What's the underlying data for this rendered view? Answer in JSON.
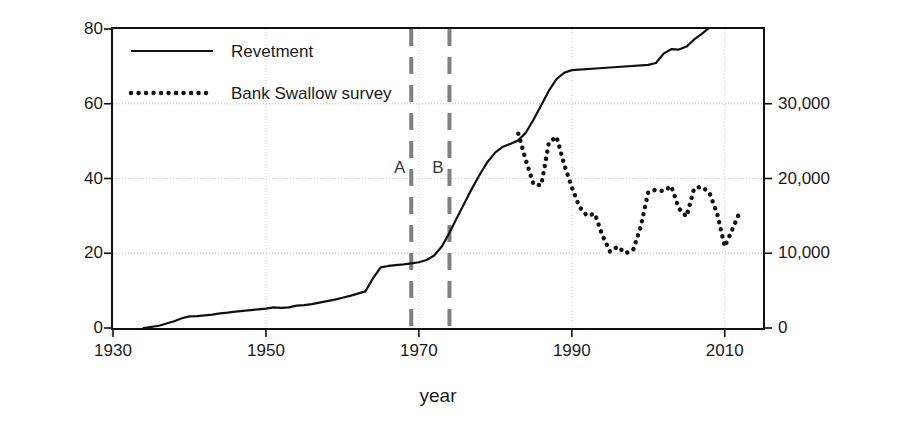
{
  "chart_data": {
    "type": "line",
    "title": "",
    "xlabel": "year",
    "ylabel_left": "Revetment length (km)",
    "ylabel_right": "Bank Swallow burrows",
    "xlim": [
      1930,
      2015
    ],
    "ylim_left": [
      0,
      80
    ],
    "ylim_right": [
      0,
      40000
    ],
    "xticks": [
      1930,
      1950,
      1970,
      1990,
      2010
    ],
    "xticklabels": [
      "1930",
      "1950",
      "1970",
      "1990",
      "2010"
    ],
    "yticks_left": [
      0,
      20,
      40,
      60,
      80
    ],
    "yticklabels_left": [
      "0",
      "20",
      "40",
      "60",
      "80"
    ],
    "yticks_right": [
      0,
      10000,
      20000,
      30000
    ],
    "yticklabels_right": [
      "0",
      "10,000",
      "20,000",
      "30,000"
    ],
    "grid": true,
    "grid_color": "#cccccc",
    "legend_position": "top-left",
    "series": [
      {
        "name": "Revetment",
        "style": "solid",
        "color": "#111111",
        "axis": "left",
        "x": [
          1934,
          1936,
          1938,
          1939,
          1940,
          1941,
          1942,
          1943,
          1944,
          1945,
          1946,
          1947,
          1948,
          1949,
          1950,
          1951,
          1952,
          1953,
          1954,
          1955,
          1956,
          1957,
          1958,
          1959,
          1960,
          1961,
          1962,
          1963,
          1964,
          1965,
          1966,
          1967,
          1968,
          1969,
          1970,
          1971,
          1972,
          1973,
          1974,
          1975,
          1976,
          1977,
          1978,
          1979,
          1980,
          1981,
          1982,
          1983,
          1984,
          1985,
          1986,
          1987,
          1988,
          1989,
          1990,
          1995,
          2000,
          2001,
          2002,
          2003,
          2004,
          2005,
          2006,
          2007,
          2008,
          2009
        ],
        "y": [
          0.0,
          0.6,
          1.8,
          2.6,
          3.1,
          3.2,
          3.4,
          3.6,
          3.9,
          4.1,
          4.4,
          4.6,
          4.8,
          5.0,
          5.2,
          5.5,
          5.4,
          5.5,
          6.0,
          6.1,
          6.4,
          6.8,
          7.2,
          7.6,
          8.1,
          8.6,
          9.2,
          9.8,
          13.3,
          16.2,
          16.6,
          16.8,
          17.0,
          17.3,
          17.6,
          18.2,
          19.4,
          21.8,
          25.5,
          29.6,
          33.6,
          37.5,
          41.2,
          44.5,
          47.0,
          48.5,
          49.3,
          50.2,
          52.3,
          55.8,
          59.6,
          63.5,
          66.6,
          68.3,
          69.0,
          69.7,
          70.4,
          70.9,
          73.4,
          74.6,
          74.5,
          75.3,
          77.2,
          78.7,
          80.4,
          81.8
        ]
      },
      {
        "name": "Bank Swallow survey",
        "style": "dotted",
        "color": "#111111",
        "axis": "right",
        "x": [
          1983,
          1984,
          1985,
          1986,
          1987,
          1988,
          1989,
          1990,
          1991,
          1992,
          1993,
          1994,
          1995,
          1996,
          1997,
          1998,
          1999,
          2000,
          2001,
          2002,
          2003,
          2004,
          2005,
          2006,
          2007,
          2008,
          2009,
          2010,
          2011,
          2012
        ],
        "y": [
          26000,
          22400,
          19200,
          19100,
          24800,
          25600,
          21900,
          18800,
          16200,
          15000,
          15300,
          12400,
          10200,
          10900,
          10000,
          10400,
          13500,
          18200,
          18500,
          18300,
          19000,
          16000,
          14900,
          18700,
          18900,
          18100,
          15300,
          10900,
          13200,
          15600
        ]
      }
    ],
    "annotations": [
      {
        "label": "A",
        "x": 1969,
        "style": "dashed-vline",
        "color": "#808080"
      },
      {
        "label": "B",
        "x": 1974,
        "style": "dashed-vline",
        "color": "#808080"
      }
    ]
  },
  "legend": {
    "items": [
      {
        "label": "Revetment",
        "style": "solid"
      },
      {
        "label": "Bank Swallow survey",
        "style": "dotted"
      }
    ]
  }
}
